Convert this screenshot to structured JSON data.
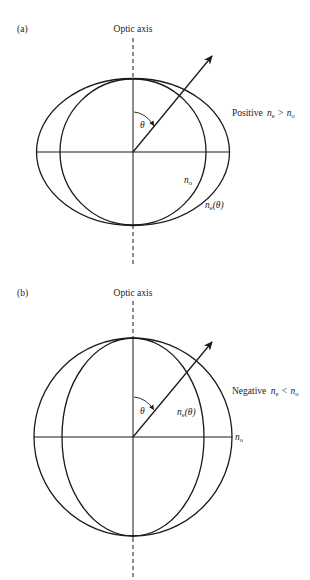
{
  "panels": [
    {
      "tag": "(a)",
      "axis_label": "Optic axis",
      "sign_label": {
        "word": "Positive",
        "lhs": "n",
        "lhs_sub": "e",
        "op": ">",
        "rhs": "n",
        "rhs_sub": "o"
      },
      "curve_labels": {
        "ordinary": {
          "n": "n",
          "sub": "o"
        },
        "extraordinary": {
          "n": "n",
          "sub": "e",
          "arg": "(θ)"
        }
      },
      "angle_label": "θ"
    },
    {
      "tag": "(b)",
      "axis_label": "Optic axis",
      "sign_label": {
        "word": "Negative",
        "lhs": "n",
        "lhs_sub": "e",
        "op": "<",
        "rhs": "n",
        "rhs_sub": "o"
      },
      "curve_labels": {
        "ordinary": {
          "n": "n",
          "sub": "o"
        },
        "extraordinary": {
          "n": "n",
          "sub": "e",
          "arg": "(θ)"
        }
      },
      "angle_label": "θ"
    }
  ],
  "colors": {
    "stroke": "#1a1a1a",
    "text": "#222222",
    "background": "#ffffff"
  }
}
